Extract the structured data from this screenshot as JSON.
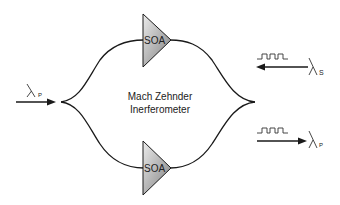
{
  "diagram": {
    "title_line1": "Mach Zehnder",
    "title_line2": "Inerferometer",
    "amplifiers": [
      {
        "label": "SOA",
        "position": "top"
      },
      {
        "label": "SOA",
        "position": "bottom"
      }
    ],
    "input_pump": {
      "symbol": "λ",
      "subscript": "P",
      "direction": "right"
    },
    "input_signal": {
      "symbol": "λ",
      "subscript": "S",
      "direction": "left"
    },
    "output_pump": {
      "symbol": "λ",
      "subscript": "P",
      "direction": "right"
    },
    "colors": {
      "line": "#1a1a1a",
      "soa_light": "#e6e6e6",
      "soa_dark": "#8a8a8a",
      "text": "#222222"
    }
  }
}
